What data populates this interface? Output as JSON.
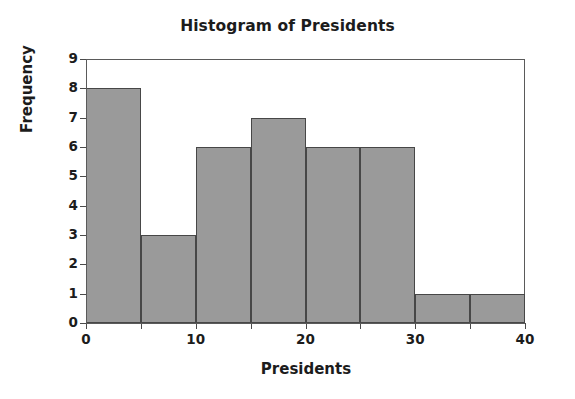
{
  "chart_data": {
    "type": "bar",
    "title": "Histogram of Presidents",
    "xlabel": "Presidents",
    "ylabel": "Frequency",
    "bin_width": 5,
    "bin_edges": [
      0,
      5,
      10,
      15,
      20,
      25,
      30,
      35,
      40
    ],
    "categories": [
      "0-5",
      "5-10",
      "10-15",
      "15-20",
      "20-25",
      "25-30",
      "30-35",
      "35-40"
    ],
    "values": [
      8,
      3,
      6,
      7,
      6,
      6,
      1,
      1
    ],
    "xlim": [
      0,
      40
    ],
    "ylim": [
      0,
      9
    ],
    "x_ticks": [
      0,
      5,
      10,
      15,
      20,
      25,
      30,
      35,
      40
    ],
    "x_tick_labels": [
      "0",
      "",
      "10",
      "",
      "20",
      "",
      "30",
      "",
      "40"
    ],
    "y_ticks": [
      0,
      1,
      2,
      3,
      4,
      5,
      6,
      7,
      8,
      9
    ],
    "y_tick_labels": [
      "0",
      "1",
      "2",
      "3",
      "4",
      "5",
      "6",
      "7",
      "8",
      "9"
    ],
    "grid": false,
    "legend": false,
    "bar_fill_color": "#9a9a9a",
    "bar_edge_color": "#474747",
    "frame_color": "#5a5a5a",
    "background_color": "#ffffff"
  }
}
